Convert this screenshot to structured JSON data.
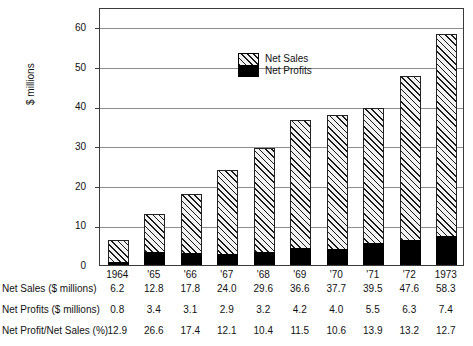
{
  "chart_data": {
    "type": "bar",
    "stacked": true,
    "title": "",
    "xlabel": "",
    "ylabel": "$ millions",
    "ylim": [
      0,
      65
    ],
    "yticks": [
      0,
      10,
      20,
      30,
      40,
      50,
      60
    ],
    "ytick_labels": [
      "0",
      "10",
      "20",
      "30",
      "40",
      "50",
      "60"
    ],
    "grid": true,
    "legend_position": "upper-left-inside",
    "categories": [
      "1964",
      "'65",
      "'66",
      "'67",
      "'68",
      "'69",
      "'70",
      "'71",
      "'72",
      "1973"
    ],
    "series": [
      {
        "name": "Net Sales",
        "unit": "$ millions",
        "fill": "diagonal-hatch",
        "values": [
          6.2,
          12.8,
          17.8,
          24.0,
          29.6,
          36.6,
          37.7,
          39.5,
          47.6,
          58.3
        ]
      },
      {
        "name": "Net Profits",
        "unit": "$ millions",
        "fill": "solid-black",
        "values": [
          0.8,
          3.4,
          3.1,
          2.9,
          3.2,
          4.2,
          4.0,
          5.5,
          6.3,
          7.4
        ]
      }
    ],
    "annotations": []
  },
  "legend": {
    "entries": [
      {
        "label": "Net Sales",
        "swatch": "hatched"
      },
      {
        "label": "Net Profits",
        "swatch": "solid"
      }
    ]
  },
  "axis": {
    "y_title": "$ millions",
    "y_tick_labels": [
      "60",
      "50",
      "40",
      "30",
      "20",
      "10",
      "0"
    ],
    "x_tick_labels": [
      "1964",
      "'65",
      "'66",
      "'67",
      "'68",
      "'69",
      "'70",
      "'71",
      "'72",
      "1973"
    ]
  },
  "table": {
    "rows": [
      {
        "label": "Net Sales ($ millions)",
        "values": [
          "6.2",
          "12.8",
          "17.8",
          "24.0",
          "29.6",
          "36.6",
          "37.7",
          "39.5",
          "47.6",
          "58.3"
        ]
      },
      {
        "label": "Net Profits ($ millions)",
        "values": [
          "0.8",
          "3.4",
          "3.1",
          "2.9",
          "3.2",
          "4.2",
          "4.0",
          "5.5",
          "6.3",
          "7.4"
        ]
      },
      {
        "label": "Net Profit/Net Sales (%)",
        "values": [
          "12.9",
          "26.6",
          "17.4",
          "12.1",
          "10.4",
          "11.5",
          "10.6",
          "13.9",
          "13.2",
          "12.7"
        ]
      }
    ]
  },
  "colors": {
    "axis": "#3a3a3a",
    "grid": "#8d8d8d",
    "text": "#111111",
    "profit_fill": "#000000",
    "sales_fill": "#f2f2f2",
    "hatch": "#1a1a1a"
  }
}
